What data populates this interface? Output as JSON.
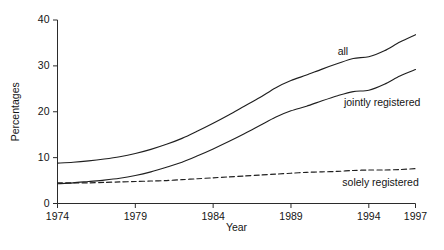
{
  "chart_data": {
    "type": "line",
    "title": "",
    "xlabel": "Year",
    "ylabel": "Percentages",
    "xlim": [
      1974,
      1997
    ],
    "ylim": [
      0,
      40
    ],
    "grid": false,
    "legend_position": "inline-labels",
    "x": [
      1974,
      1975,
      1976,
      1977,
      1978,
      1979,
      1980,
      1981,
      1982,
      1983,
      1984,
      1985,
      1986,
      1987,
      1988,
      1989,
      1990,
      1991,
      1992,
      1993,
      1994,
      1995,
      1996,
      1997
    ],
    "x_ticks": [
      1974,
      1979,
      1984,
      1989,
      1994,
      1997
    ],
    "x_tick_labels": [
      "1974",
      "1979",
      "1984",
      "1989",
      "1994",
      "1997"
    ],
    "y_ticks": [
      0,
      10,
      20,
      30,
      40
    ],
    "y_tick_labels": [
      "0",
      "10",
      "20",
      "30",
      "40"
    ],
    "series": [
      {
        "name": "all",
        "style": "solid",
        "label": "all",
        "label_x": 1992.0,
        "label_y": 33.0,
        "values": [
          8.8,
          9.0,
          9.3,
          9.7,
          10.2,
          10.9,
          11.8,
          12.9,
          14.2,
          15.8,
          17.5,
          19.3,
          21.2,
          23.1,
          25.2,
          26.8,
          28.0,
          29.3,
          30.5,
          31.6,
          32.0,
          33.3,
          35.2,
          36.8
        ]
      },
      {
        "name": "jointly registered",
        "style": "solid",
        "label": "jointly registered",
        "label_x": 1992.4,
        "label_y": 21.8,
        "values": [
          4.3,
          4.5,
          4.8,
          5.1,
          5.5,
          6.1,
          6.9,
          7.9,
          9.0,
          10.4,
          11.9,
          13.5,
          15.2,
          17.0,
          18.8,
          20.2,
          21.2,
          22.4,
          23.5,
          24.4,
          24.7,
          26.0,
          27.8,
          29.2
        ]
      },
      {
        "name": "solely registered",
        "style": "dashed",
        "label": "solely registered",
        "label_x": 1992.3,
        "label_y": 4.4,
        "values": [
          4.5,
          4.5,
          4.5,
          4.6,
          4.7,
          4.8,
          4.9,
          5.0,
          5.2,
          5.4,
          5.6,
          5.8,
          6.0,
          6.2,
          6.4,
          6.6,
          6.8,
          6.9,
          7.0,
          7.2,
          7.3,
          7.3,
          7.4,
          7.6
        ]
      }
    ]
  }
}
